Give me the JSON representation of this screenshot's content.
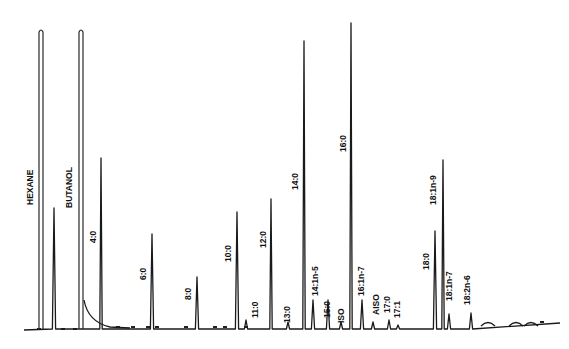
{
  "chart_data": {
    "type": "line",
    "title": "",
    "subtitle": "",
    "xlabel": "",
    "ylabel": "",
    "grid": false,
    "legend": null,
    "baseline_y_px": 329,
    "peaks": [
      {
        "label": "HEXANE",
        "x": 41,
        "top_y": 30,
        "offscale": true,
        "label_x": 33,
        "label_y": 205
      },
      {
        "label": "",
        "x": 54,
        "top_y": 208,
        "offscale": false
      },
      {
        "label": "BUTANOL",
        "x": 81,
        "top_y": 30,
        "offscale": true,
        "label_x": 72,
        "label_y": 208
      },
      {
        "label": "4:0",
        "x": 101,
        "top_y": 158,
        "label_x": 96,
        "label_y": 243
      },
      {
        "label": "6:0",
        "x": 152,
        "top_y": 234,
        "label_x": 146,
        "label_y": 280
      },
      {
        "label": "8:0",
        "x": 197,
        "top_y": 277,
        "label_x": 191,
        "label_y": 300
      },
      {
        "label": "10:0",
        "x": 237,
        "top_y": 212,
        "label_x": 231,
        "label_y": 262
      },
      {
        "label": "11:0",
        "x": 246,
        "top_y": 320,
        "label_x": 258,
        "label_y": 318
      },
      {
        "label": "12:0",
        "x": 271,
        "top_y": 199,
        "label_x": 266,
        "label_y": 248
      },
      {
        "label": "13:0",
        "x": 288,
        "top_y": 322,
        "label_x": 290,
        "label_y": 323
      },
      {
        "label": "14:0",
        "x": 304,
        "top_y": 41,
        "label_x": 298,
        "label_y": 190
      },
      {
        "label": "14:1n-5",
        "x": 313,
        "top_y": 300,
        "label_x": 318,
        "label_y": 296
      },
      {
        "label": "15:0",
        "x": 328,
        "top_y": 300,
        "label_x": 330,
        "label_y": 318
      },
      {
        "label": "ISO",
        "x": 341,
        "top_y": 322,
        "label_x": 344,
        "label_y": 323
      },
      {
        "label": "16:0",
        "x": 351,
        "top_y": 23,
        "label_x": 346,
        "label_y": 152
      },
      {
        "label": "16:1n-7",
        "x": 362,
        "top_y": 300,
        "label_x": 364,
        "label_y": 296
      },
      {
        "label": "AISO",
        "x": 373,
        "top_y": 322,
        "label_x": 379,
        "label_y": 315
      },
      {
        "label": "17:0",
        "x": 389,
        "top_y": 320,
        "label_x": 390,
        "label_y": 313
      },
      {
        "label": "17:1",
        "x": 398,
        "top_y": 325,
        "label_x": 400,
        "label_y": 318
      },
      {
        "label": "18:0",
        "x": 435,
        "top_y": 231,
        "label_x": 429,
        "label_y": 270
      },
      {
        "label": "18:1n-9",
        "x": 443,
        "top_y": 160,
        "label_x": 436,
        "label_y": 205
      },
      {
        "label": "18:1n-7",
        "x": 449,
        "top_y": 314,
        "label_x": 452,
        "label_y": 301
      },
      {
        "label": "18:2n-6",
        "x": 471,
        "top_y": 313,
        "label_x": 470,
        "label_y": 305
      }
    ],
    "broad_humps_x": [
      488,
      516,
      531
    ],
    "event_marks": [
      {
        "x": 39,
        "y": 329
      },
      {
        "x": 63,
        "y": 329
      },
      {
        "x": 75,
        "y": 329
      },
      {
        "x": 118,
        "y": 327
      },
      {
        "x": 133,
        "y": 327
      },
      {
        "x": 148,
        "y": 327
      },
      {
        "x": 157,
        "y": 327
      },
      {
        "x": 186,
        "y": 327
      },
      {
        "x": 215,
        "y": 327
      },
      {
        "x": 225,
        "y": 327
      },
      {
        "x": 246,
        "y": 327
      },
      {
        "x": 542,
        "y": 322
      }
    ]
  }
}
